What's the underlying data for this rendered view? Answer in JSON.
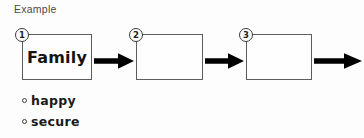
{
  "heading": {
    "label": "Example"
  },
  "diagram": {
    "type": "sequence-flow",
    "steps": [
      {
        "number": "1",
        "text": "Family",
        "filled": true
      },
      {
        "number": "2",
        "text": "",
        "filled": false
      },
      {
        "number": "3",
        "text": "",
        "filled": false
      }
    ],
    "arrow_count": 4,
    "arrow_color": "#000000",
    "box_border_color": "#5d5d5d",
    "marker_border_color": "#3a3a3a"
  },
  "answers": {
    "bullet_icon": "hollow-circle-bullet",
    "items": [
      {
        "label": "happy"
      },
      {
        "label": "secure"
      }
    ]
  },
  "page": {
    "background_color": "#fdfdfd",
    "ink_color": "#1a1a1a"
  }
}
